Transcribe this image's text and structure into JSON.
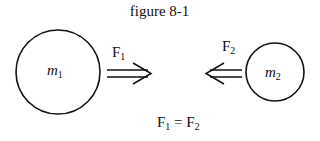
{
  "figure": {
    "title": "figure 8-1",
    "mass1": {
      "symbol": "m",
      "subscript": "1"
    },
    "mass2": {
      "symbol": "m",
      "subscript": "2"
    },
    "force1": {
      "symbol": "F",
      "subscript": "1",
      "direction": "right"
    },
    "force2": {
      "symbol": "F",
      "subscript": "2",
      "direction": "left"
    },
    "equation": {
      "lhs": "F",
      "lhs_sub": "1",
      "op": " = ",
      "rhs": "F",
      "rhs_sub": "2"
    }
  }
}
